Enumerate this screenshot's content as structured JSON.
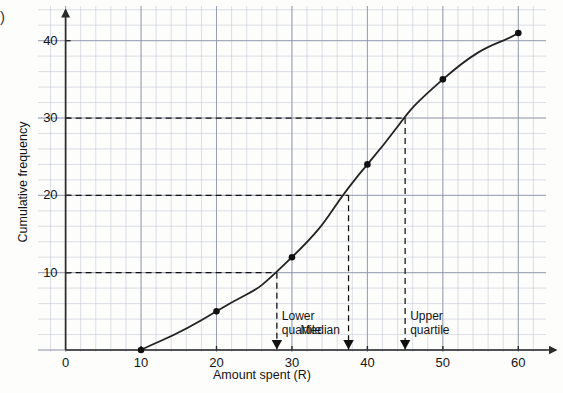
{
  "page": {
    "corner_marker": ")"
  },
  "chart_data": {
    "type": "line",
    "title": "",
    "subtitle": "",
    "xlabel": "Amount spent (R)",
    "ylabel": "Cumulative frequency",
    "xlim": [
      0,
      62
    ],
    "ylim": [
      0,
      44
    ],
    "xticks": [
      0,
      10,
      20,
      30,
      40,
      50,
      60
    ],
    "yticks": [
      10,
      20,
      30,
      40
    ],
    "xtick_labels": [
      "0",
      "10",
      "20",
      "30",
      "40",
      "50",
      "60"
    ],
    "ytick_labels": [
      "10",
      "20",
      "30",
      "40"
    ],
    "grid": true,
    "grid_minor_step_x": 2,
    "grid_minor_step_y": 2,
    "grid_major_step_x": 10,
    "grid_major_step_y": 10,
    "legend": "none",
    "series": [
      {
        "name": "Cumulative frequency",
        "x": [
          10,
          20,
          30,
          40,
          50,
          60
        ],
        "values": [
          0,
          5,
          12,
          24,
          35,
          41
        ],
        "marker": "filled-circle",
        "line": "solid"
      }
    ],
    "guide_lines": [
      {
        "name": "lower-quartile",
        "y": 10,
        "x": 28,
        "style": "dashed"
      },
      {
        "name": "median",
        "y": 20,
        "x": 37.5,
        "style": "dashed"
      },
      {
        "name": "upper-quartile",
        "y": 30,
        "x": 45,
        "style": "dashed"
      }
    ],
    "annotations": [
      {
        "name": "lower-quartile",
        "line1": "Lower",
        "line2": "quartile",
        "x": 28,
        "marker": "down-triangle"
      },
      {
        "name": "median",
        "line1": "Median",
        "line2": "",
        "x": 37.5,
        "marker": "down-triangle"
      },
      {
        "name": "upper-quartile",
        "line1": "Upper",
        "line2": "quartile",
        "x": 45,
        "marker": "down-triangle"
      }
    ],
    "colors": {
      "curve": "#232323",
      "marker": "#111111",
      "axis": "#2b2b2b",
      "grid_major": "#8d93a8",
      "grid_minor": "#c3c8d6",
      "text": "#141414"
    }
  }
}
